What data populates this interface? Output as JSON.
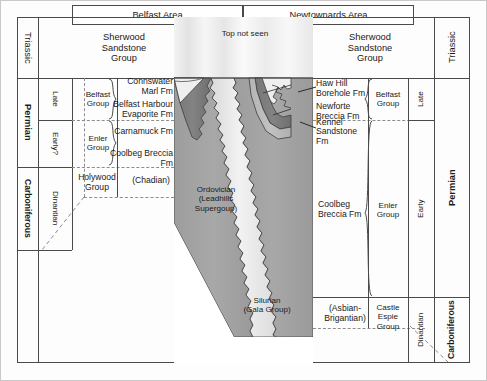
{
  "figure": {
    "kind": "stratigraphic-correlation-chart",
    "headers": [
      {
        "id": "belfast-area",
        "label": "Belfast Area"
      },
      {
        "id": "newtownards-area",
        "label": "Newtownards Area"
      }
    ]
  },
  "left_scale": {
    "periods": [
      {
        "label": "Triassic",
        "bold": false
      },
      {
        "label": "Permian",
        "bold": true
      },
      {
        "label": "Carboniferous",
        "bold": true
      }
    ],
    "epochs": [
      {
        "label": "Late"
      },
      {
        "label": "Early?"
      },
      {
        "label": "Dinantian"
      }
    ]
  },
  "right_scale": {
    "periods": [
      {
        "label": "Triassic",
        "bold": false
      },
      {
        "label": "Permian",
        "bold": true
      },
      {
        "label": "Carboniferous",
        "bold": true
      }
    ],
    "epochs": [
      {
        "label": "Late"
      },
      {
        "label": "Early"
      },
      {
        "label": "Dinantian"
      }
    ]
  },
  "belfast": {
    "groups": [
      {
        "label": "Belfast\nGroup"
      },
      {
        "label": "Enler\nGroup"
      }
    ],
    "units": [
      {
        "label": "Sherwood\nSandstone\nGroup"
      },
      {
        "label": "Connswater Marl Fm"
      },
      {
        "label": "Belfast Harbour\nEvaporite Fm"
      },
      {
        "label": "Carnamuck Fm"
      },
      {
        "label": "Coolbeg Breccia Fm"
      },
      {
        "label": "Holywood\nGroup"
      },
      {
        "label": "(Chadian)"
      }
    ]
  },
  "newtownards": {
    "groups": [
      {
        "label": "Belfast\nGroup"
      },
      {
        "label": "Enler\nGroup"
      },
      {
        "label": "Castle\nEspie\nGroup"
      }
    ],
    "units": [
      {
        "label": "Sherwood\nSandstone\nGroup"
      },
      {
        "label": "Haw Hill Borehole Fm"
      },
      {
        "label": "Newforte Breccia Fm"
      },
      {
        "label": "Kennel Sandstone Fm"
      },
      {
        "label": "Coolbeg Breccia Fm"
      },
      {
        "label": "(Asbian-\nBrigantian)"
      }
    ]
  },
  "basement": {
    "top_label": "Top not seen",
    "ordovician": "Ordovician\n(Leadhills\nSupergoup)",
    "silurian": "Silurian\n(Gala Group)"
  },
  "colors": {
    "ink": "#1b1b1b",
    "rule": "#4a4a4a",
    "dashed": "#8d8d8d",
    "pale": "#eeeeee",
    "light_grey": "#d4d4d4",
    "mid_grey": "#b2b2b2",
    "dark_grey": "#8e8e8e",
    "darker_grey": "#777777"
  }
}
